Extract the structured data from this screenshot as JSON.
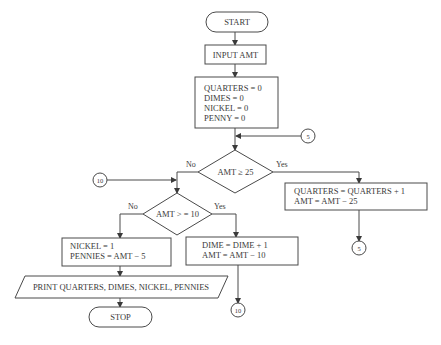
{
  "flowchart": {
    "start": {
      "label": "START"
    },
    "input": {
      "label": "INPUT AMT"
    },
    "init": {
      "lines": [
        "QUARTERS = 0",
        "DIMES = 0",
        "NICKEL = 0",
        "PENNY = 0"
      ]
    },
    "decision_quarters": {
      "label": "AMT ≥ 25",
      "no": "No",
      "yes": "Yes"
    },
    "quarters_process": {
      "lines": [
        "QUARTERS = QUARTERS + 1",
        "AMT = AMT − 25"
      ]
    },
    "decision_dimes": {
      "label": "AMT > = 10",
      "no": "No",
      "yes": "Yes"
    },
    "nickel_process": {
      "lines": [
        "NICKEL = 1",
        "PENNIES = AMT − 5"
      ]
    },
    "dime_process": {
      "lines": [
        "DIME = DIME + 1",
        "AMT = AMT − 10"
      ]
    },
    "output": {
      "label": "PRINT QUARTERS, DIMES, NICKEL, PENNIES"
    },
    "stop": {
      "label": "STOP"
    },
    "connectors": {
      "c5_entry": "5",
      "c5_exit": "5",
      "c10_entry": "10",
      "c10_exit": "10"
    }
  }
}
